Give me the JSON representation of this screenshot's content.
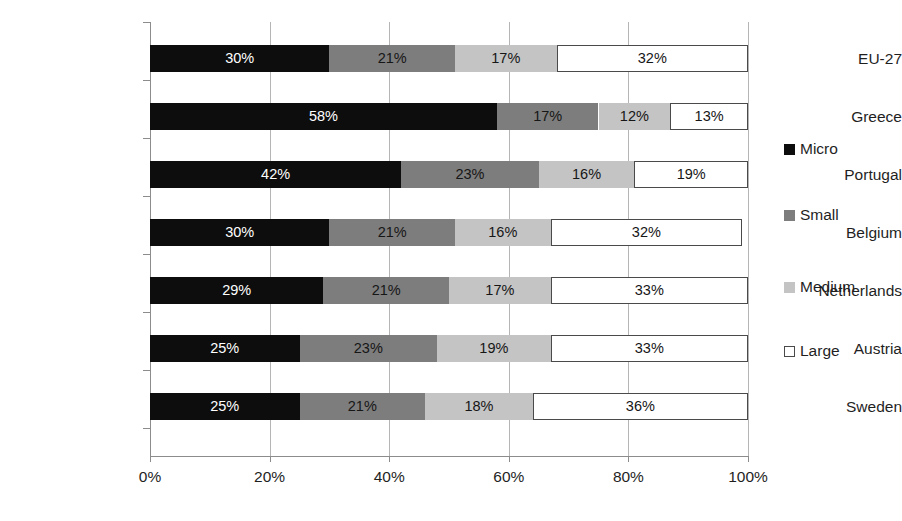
{
  "chart_data": {
    "type": "bar",
    "subtype": "horizontal-stacked-100",
    "title": "",
    "subtitle": "",
    "xlabel": "",
    "ylabel": "",
    "xlim": [
      0,
      100
    ],
    "xtick_labels": [
      "0%",
      "20%",
      "40%",
      "60%",
      "80%",
      "100%"
    ],
    "xtick_values": [
      0,
      20,
      40,
      60,
      80,
      100
    ],
    "grid": true,
    "grid_axis": "x",
    "legend_position": "right",
    "categories": [
      "EU-27",
      "Greece",
      "Portugal",
      "Belgium",
      "Netherlands",
      "Austria",
      "Sweden"
    ],
    "series": [
      {
        "name": "Micro",
        "color": "#0d0d0d",
        "values": [
          30,
          58,
          42,
          30,
          29,
          25,
          25
        ],
        "labels": [
          "30%",
          "58%",
          "42%",
          "30%",
          "29%",
          "25%",
          "25%"
        ]
      },
      {
        "name": "Small",
        "color": "#7d7d7d",
        "values": [
          21,
          17,
          23,
          21,
          21,
          23,
          21
        ],
        "labels": [
          "21%",
          "17%",
          "23%",
          "21%",
          "21%",
          "23%",
          "21%"
        ]
      },
      {
        "name": "Medium",
        "color": "#c4c4c4",
        "values": [
          17,
          12,
          16,
          16,
          17,
          19,
          18
        ],
        "labels": [
          "17%",
          "12%",
          "16%",
          "16%",
          "17%",
          "19%",
          "18%"
        ]
      },
      {
        "name": "Large",
        "color": "#ffffff",
        "values": [
          32,
          13,
          19,
          32,
          33,
          33,
          36
        ],
        "labels": [
          "32%",
          "13%",
          "19%",
          "32%",
          "33%",
          "33%",
          "36%"
        ]
      }
    ]
  },
  "legend": {
    "items": [
      {
        "label": "Micro",
        "swatch": "micro"
      },
      {
        "label": "Small",
        "swatch": "small"
      },
      {
        "label": "Medium",
        "swatch": "medium"
      },
      {
        "label": "Large",
        "swatch": "large"
      }
    ]
  }
}
